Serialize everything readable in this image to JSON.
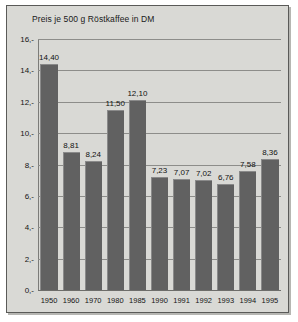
{
  "chart_data": {
    "type": "bar",
    "title": "Preis je 500 g Röstkaffee in DM",
    "xlabel": "",
    "ylabel": "",
    "ylim": [
      0,
      16
    ],
    "grid": true,
    "legend": "none",
    "categories": [
      "1950",
      "1960",
      "1970",
      "1980",
      "1985",
      "1990",
      "1991",
      "1992",
      "1993",
      "1994",
      "1995"
    ],
    "values": [
      14.4,
      8.81,
      8.24,
      11.5,
      12.1,
      7.23,
      7.07,
      7.02,
      6.76,
      7.58,
      8.36
    ],
    "value_labels": [
      "14,40",
      "8,81",
      "8,24",
      "11,50",
      "12,10",
      "7,23",
      "7,07",
      "7,02",
      "6,76",
      "7,58",
      "8,36"
    ],
    "ytick_values": [
      16,
      14,
      12,
      10,
      8,
      6,
      4,
      2,
      0
    ],
    "ytick_labels": [
      "16,-",
      "14,-",
      "12,-",
      "10,-",
      "8,-",
      "6,-",
      "4,-",
      "2,-",
      "0,-"
    ],
    "colors": {
      "bar": "#616161",
      "background": "#d9d9d5",
      "gridline": "#8d8d8a",
      "text": "#141414",
      "frame": "#5a5a58"
    }
  }
}
